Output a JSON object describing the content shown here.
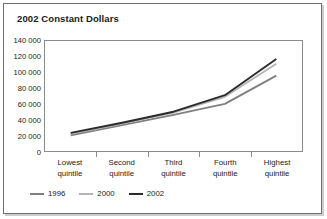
{
  "figure": {
    "title": "2002 Constant Dollars"
  },
  "chart_data": {
    "type": "line",
    "title": "2002 Constant Dollars",
    "xlabel": "",
    "ylabel": "",
    "categories": [
      "Lowest quintile",
      "Second quintile",
      "Third quintile",
      "Fourth quintile",
      "Highest quintile"
    ],
    "category_lines": [
      [
        "Lowest",
        "quintile"
      ],
      [
        "Second",
        "quintile"
      ],
      [
        "Third",
        "quintile"
      ],
      [
        "Fourth",
        "quintile"
      ],
      [
        "Highest",
        "quintile"
      ]
    ],
    "series": [
      {
        "name": "1996",
        "color": "#808080",
        "values": [
          20000,
          33000,
          46000,
          60000,
          96000
        ]
      },
      {
        "name": "2000",
        "color": "#b5b5b5",
        "values": [
          22000,
          35000,
          49000,
          69000,
          111000
        ]
      },
      {
        "name": "2002",
        "color": "#2b2b2b",
        "values": [
          23000,
          36000,
          50000,
          71000,
          117000
        ]
      }
    ],
    "ylim": [
      0,
      140000
    ],
    "ytick_step": 20000,
    "ytick_labels": [
      "140 000",
      "120 000",
      "100 000",
      "80 000",
      "60 000",
      "40 000",
      "20 000",
      "0"
    ],
    "ytick_values": [
      140000,
      120000,
      100000,
      80000,
      60000,
      40000,
      20000,
      0
    ],
    "grid": false,
    "legend_position": "bottom-left",
    "legend_entries": [
      "1996",
      "2000",
      "2002"
    ]
  }
}
